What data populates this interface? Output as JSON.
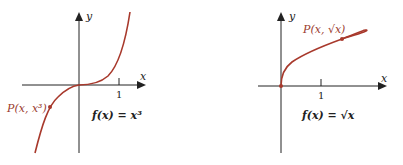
{
  "colors": {
    "curve": "#a8392c",
    "axis": "#222222",
    "point_label": "#9a3b2e"
  },
  "left_graph": {
    "x_axis_label": "x",
    "y_axis_label": "y",
    "tick_label": "1",
    "point_label": "P(x, x³)",
    "function_label": "f(x) = x³"
  },
  "right_graph": {
    "x_axis_label": "x",
    "y_axis_label": "y",
    "tick_label": "1",
    "point_label": "P(x, √x)",
    "function_label": "f(x) = √x"
  }
}
